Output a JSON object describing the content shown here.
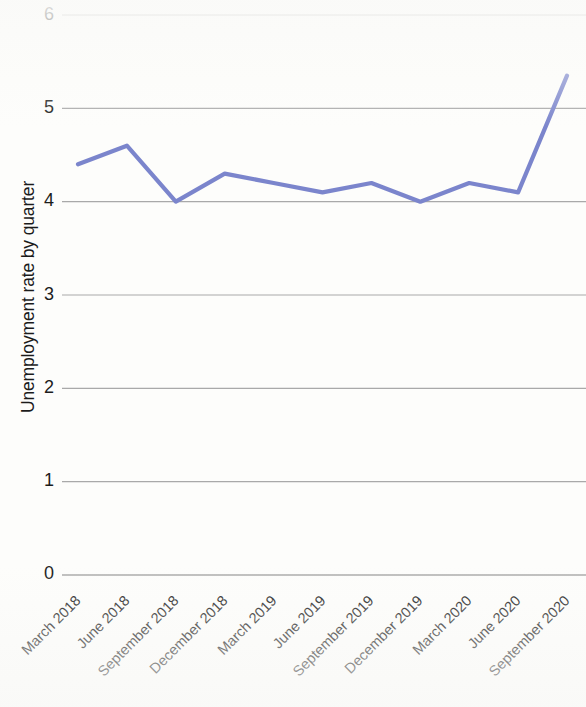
{
  "chart_data": {
    "type": "line",
    "title": "",
    "xlabel": "",
    "ylabel": "Unemployment rate by quarter",
    "ylim": [
      0,
      6
    ],
    "yticks": [
      "0",
      "1",
      "2",
      "3",
      "4",
      "5",
      "6"
    ],
    "grid": "horizontal",
    "legend": "none",
    "series_color": "#7b85cc",
    "categories": [
      "March 2018",
      "June 2018",
      "September 2018",
      "December 2018",
      "March 2019",
      "June 2019",
      "September 2019",
      "December 2019",
      "March 2020",
      "June 2020",
      "September 2020"
    ],
    "values": [
      4.4,
      4.6,
      4.0,
      4.3,
      4.2,
      4.1,
      4.2,
      4.0,
      4.2,
      4.1,
      5.35
    ],
    "series": [
      {
        "name": "Unemployment rate by quarter",
        "values": [
          4.4,
          4.6,
          4.0,
          4.3,
          4.2,
          4.1,
          4.2,
          4.0,
          4.2,
          4.1,
          5.35
        ]
      }
    ]
  },
  "axes": {
    "y_title": "Unemployment rate by quarter",
    "y_tick_0": "0",
    "y_tick_1": "1",
    "y_tick_2": "2",
    "y_tick_3": "3",
    "y_tick_4": "4",
    "y_tick_5": "5",
    "y_tick_6": "6"
  },
  "colors": {
    "line": "#7b85cc",
    "gridline": "#a9a9a9",
    "text": "#1c1c1c",
    "background": "#fdfdfb"
  }
}
